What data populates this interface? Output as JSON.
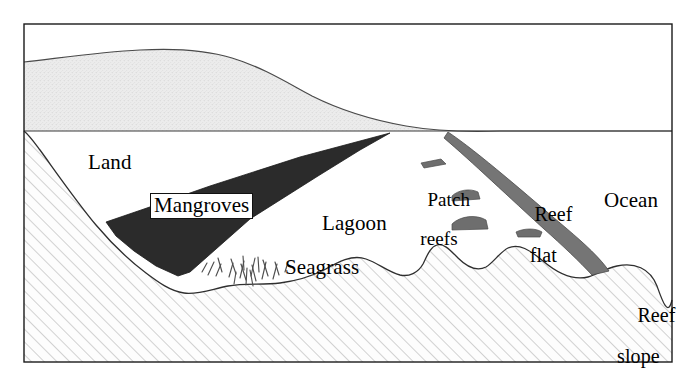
{
  "figure": {
    "type": "cross-section-diagram",
    "frame_color": "#000000",
    "background_color": "#ffffff"
  },
  "labels": {
    "land": "Land",
    "mangroves": "Mangroves",
    "lagoon": "Lagoon",
    "ocean": "Ocean",
    "seagrass": "Seagrass",
    "patch_reefs_line1": "Patch",
    "patch_reefs_line2": "reefs",
    "reef_flat_line1": "Reef",
    "reef_flat_line2": "flat",
    "reef_slope_line1": "Reef",
    "reef_slope_line2": "slope"
  },
  "zones": [
    {
      "name": "land-mass",
      "label": "Land",
      "fill": "stipple-light-gray",
      "color": "#e8e8e8"
    },
    {
      "name": "mangrove-wedge",
      "label": "Mangroves",
      "fill": "solid-dark",
      "color": "#2b2b2b"
    },
    {
      "name": "lagoon-water",
      "label": "Lagoon",
      "fill": "white",
      "color": "#ffffff"
    },
    {
      "name": "seagrass-bed",
      "label": "Seagrass",
      "fill": "line-tufts",
      "color": "#555555"
    },
    {
      "name": "patch-reefs",
      "label": "Patch reefs",
      "fill": "solid-gray",
      "color": "#6e6e6e"
    },
    {
      "name": "reef-flat-wedge",
      "label": "Reef flat",
      "fill": "solid-gray",
      "color": "#737373"
    },
    {
      "name": "reef-slope",
      "label": "Reef slope",
      "fill": "diagonal-hatch",
      "color": "#c9c9c9"
    },
    {
      "name": "ocean-water",
      "label": "Ocean",
      "fill": "white",
      "color": "#ffffff"
    },
    {
      "name": "substrate-bedrock",
      "label": "",
      "fill": "diagonal-hatch",
      "color": "#c9c9c9"
    }
  ],
  "lines": {
    "water_surface": "horizontal sea-level line",
    "frame": "rectangular border"
  },
  "colors": {
    "stipple": "#e9e9e9",
    "mangrove_dark": "#2b2b2b",
    "reef_gray": "#737373",
    "patch_reef_gray": "#6e6e6e",
    "hatch_line": "#b9b9b9",
    "outline": "#1a1a1a",
    "text": "#000000"
  }
}
